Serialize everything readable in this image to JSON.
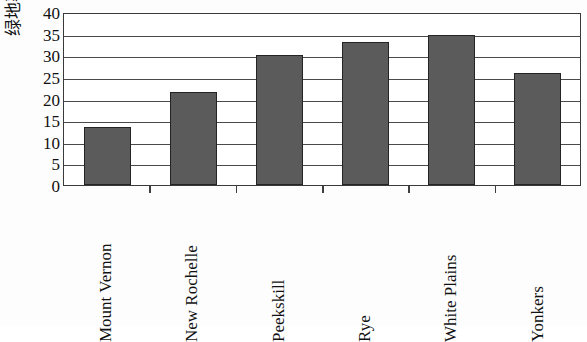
{
  "chart_data": {
    "type": "bar",
    "title": "",
    "xlabel": "",
    "ylabel": "绿地率/%",
    "categories": [
      "Mount Vernon",
      "New Rochelle",
      "Peekskill",
      "Rye",
      "White Plains",
      "Yonkers"
    ],
    "values": [
      13.5,
      21.5,
      30,
      33,
      34.8,
      26
    ],
    "ylim": [
      0,
      40
    ],
    "yticks": [
      0,
      5,
      10,
      15,
      20,
      25,
      30,
      35,
      40
    ],
    "ytick_labels": [
      "0",
      "5",
      "10",
      "15",
      "20",
      "25",
      "30",
      "35",
      "40"
    ],
    "grid": true,
    "legend": false,
    "bar_color": "#5b5b5b",
    "bar_edge_color": "#242424",
    "axis_color": "#3a3a3a",
    "gridline_color": "#4a4a4a",
    "background": "#ffffff"
  }
}
